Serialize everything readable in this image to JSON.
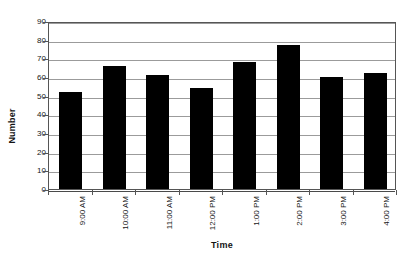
{
  "chart_data": {
    "type": "bar",
    "title": "",
    "xlabel": "Time",
    "ylabel": "Number",
    "categories": [
      "9:00 AM",
      "10:00 AM",
      "11:00 AM",
      "12:00 PM",
      "1:00 PM",
      "2:00 PM",
      "3:00 PM",
      "4:00 PM"
    ],
    "values": [
      52,
      66,
      61,
      54,
      68,
      77,
      60,
      62
    ],
    "ylim": [
      0,
      90
    ],
    "ytick_labels": [
      "90",
      "80",
      "70",
      "60",
      "50",
      "40",
      "30",
      "20",
      "10",
      "0"
    ],
    "ytick_values": [
      90,
      80,
      70,
      60,
      50,
      40,
      30,
      20,
      10,
      0
    ],
    "grid": true,
    "legend": false,
    "bar_color": "#000000",
    "gridline_color": "#9b9b9b",
    "axis_color": "#555555",
    "background_color": "#ffffff"
  }
}
